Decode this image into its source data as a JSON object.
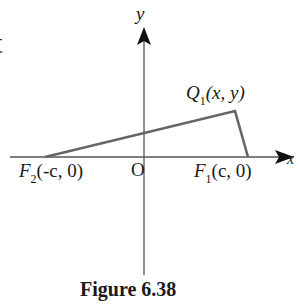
{
  "diagram": {
    "axes": {
      "x_label": "x",
      "y_label": "y",
      "origin_label": "O"
    },
    "points": {
      "F2": {
        "name": "F",
        "sub": "2",
        "coords": "(-c, 0)"
      },
      "F1": {
        "name": "F",
        "sub": "1",
        "coords": "(c, 0)"
      },
      "Q1": {
        "name": "Q",
        "sub": "1",
        "coords": "(x, y)"
      }
    },
    "caption": "Figure 6.38",
    "left_fragment": "t",
    "colors": {
      "axes": "#555555",
      "triangle": "#666666",
      "text": "#1a1a1a"
    }
  }
}
